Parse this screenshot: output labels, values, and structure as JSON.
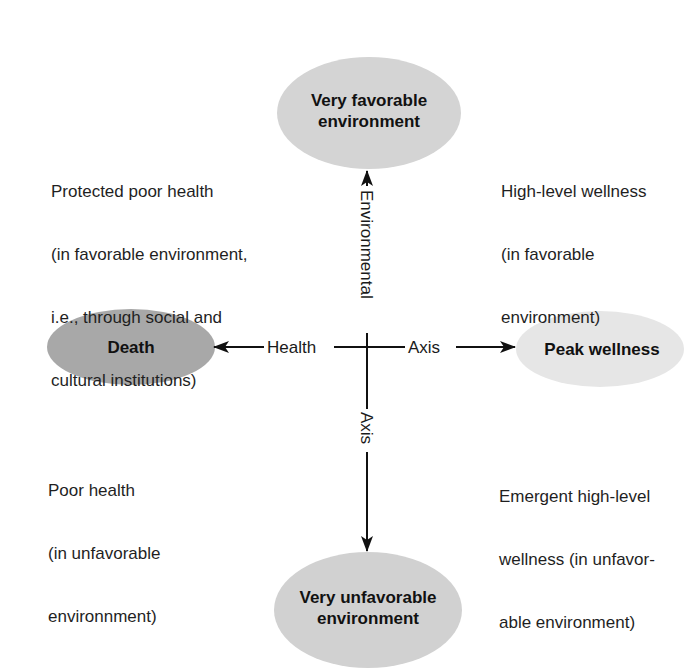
{
  "diagram": {
    "type": "health-environment-grid",
    "nodes": {
      "top": {
        "line1": "Very favorable",
        "line2": "environment",
        "fill": "#d4d4d4"
      },
      "left": {
        "label": "Death",
        "fill": "#a8a8a8"
      },
      "right": {
        "label": "Peak wellness",
        "fill": "#e6e6e6"
      },
      "bottom": {
        "line1": "Very unfavorable",
        "line2": "environment",
        "fill": "#d1d1d1"
      }
    },
    "axes": {
      "horizontal": {
        "left_label": "Health",
        "right_label": "Axis"
      },
      "vertical": {
        "top_label": "Environmental",
        "bottom_label": "Axis"
      }
    },
    "quadrants": {
      "top_left": {
        "lines": [
          "Protected poor health",
          "(in favorable environment,",
          "i.e., through social and",
          "cultural institutions)"
        ]
      },
      "top_right": {
        "lines": [
          "High-level wellness",
          "(in favorable",
          "environment)"
        ]
      },
      "bottom_left": {
        "lines": [
          "Poor health",
          "(in unfavorable",
          "environnment)"
        ]
      },
      "bottom_right": {
        "lines": [
          "Emergent high-level",
          "wellness (in unfavor-",
          "able environment)"
        ]
      }
    }
  }
}
